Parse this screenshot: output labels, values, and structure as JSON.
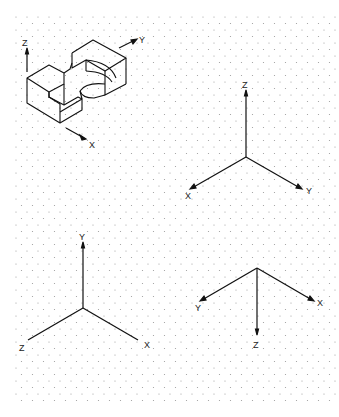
{
  "sheet": {
    "background": "#ffffff",
    "grid": {
      "type": "isometric-dot",
      "color": "#9a9a9a",
      "x_start": 16,
      "x_end": 336,
      "y_start": 17,
      "y_end": 405,
      "dx": 11,
      "dy": 13
    }
  },
  "object": {
    "label": "isometric block with U-slot and cylindrical cutout",
    "axes": {
      "z": "Z",
      "y": "Y",
      "x": "X"
    }
  },
  "axis_sets": [
    {
      "id": "right-upper",
      "labels": {
        "up": "Z",
        "left": "X",
        "right": "Y"
      }
    },
    {
      "id": "left-lower",
      "labels": {
        "up": "Y",
        "left": "Z",
        "right": "X"
      }
    },
    {
      "id": "right-lower",
      "labels": {
        "down": "Z",
        "left": "Y",
        "right": "X"
      }
    }
  ]
}
